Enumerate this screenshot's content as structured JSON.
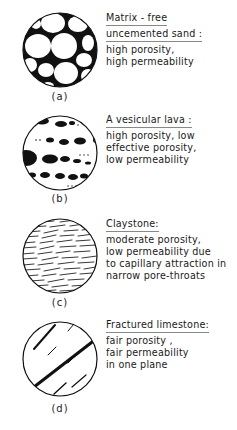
{
  "panels": [
    {
      "id": "a",
      "caption": "(a)",
      "title_lines": [
        "Matrix - free",
        "uncemented sand :"
      ],
      "body_lines": [
        "high porosity,",
        "high permeability"
      ]
    },
    {
      "id": "b",
      "caption": "(b)",
      "title_lines": [
        "A vesicular lava :"
      ],
      "body_lines": [
        "high porosity, low",
        "effective porosity,",
        "low permeability"
      ]
    },
    {
      "id": "c",
      "caption": "(c)",
      "title_lines": [
        "Claystone:"
      ],
      "body_lines": [
        "moderate porosity,",
        "low permeability due",
        "to capillary attraction in",
        "narrow pore-throats"
      ]
    },
    {
      "id": "d",
      "caption": "(d)",
      "title_lines": [
        "Fractured limestone:"
      ],
      "body_lines": [
        "fair porosity ,",
        "fair permeability",
        "in one plane"
      ]
    }
  ],
  "colors": {
    "ink": "#111111",
    "background": "#ffffff"
  }
}
